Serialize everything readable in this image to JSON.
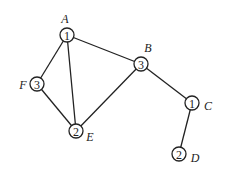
{
  "graph": {
    "nodes": [
      {
        "id": "A",
        "label": "A",
        "value": "1",
        "x": 67,
        "y": 35,
        "lx": 65,
        "ly": 19
      },
      {
        "id": "B",
        "label": "B",
        "value": "3",
        "x": 141,
        "y": 64,
        "lx": 148,
        "ly": 48
      },
      {
        "id": "C",
        "label": "C",
        "value": "1",
        "x": 192,
        "y": 103,
        "lx": 208,
        "ly": 106
      },
      {
        "id": "D",
        "label": "D",
        "value": "2",
        "x": 179,
        "y": 154,
        "lx": 195,
        "ly": 158
      },
      {
        "id": "E",
        "label": "E",
        "value": "2",
        "x": 76,
        "y": 131,
        "lx": 90,
        "ly": 137
      },
      {
        "id": "F",
        "label": "F",
        "value": "3",
        "x": 37,
        "y": 84,
        "lx": 23,
        "ly": 85
      }
    ],
    "edges": [
      [
        "A",
        "B"
      ],
      [
        "A",
        "F"
      ],
      [
        "A",
        "E"
      ],
      [
        "F",
        "E"
      ],
      [
        "E",
        "B"
      ],
      [
        "B",
        "C"
      ],
      [
        "C",
        "D"
      ]
    ],
    "node_radius": 7
  }
}
